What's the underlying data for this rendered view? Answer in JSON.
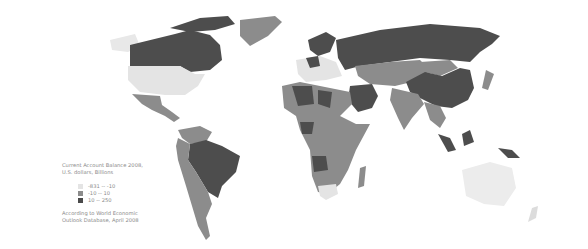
{
  "legend": {
    "title_line1": "Current Account Balance 2008,",
    "title_line2": "U.S. dollars, Billions",
    "items": [
      {
        "label": "-831 -- -10",
        "color": "#e4e4e4"
      },
      {
        "label": "-10 -- 10",
        "color": "#8c8c8c"
      },
      {
        "label": "10 -- 250",
        "color": "#4a4a4a"
      }
    ],
    "source_line1": "According to World Economic",
    "source_line2": "Outlook Database, April 2008"
  },
  "colors": {
    "low": "#e4e4e4",
    "mid": "#8c8c8c",
    "high": "#4a4a4a",
    "background": "#ffffff"
  }
}
